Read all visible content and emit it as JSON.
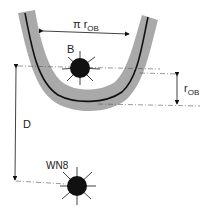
{
  "diagram": {
    "colors": {
      "band": "#a9a9a9",
      "ink": "#111111",
      "guide": "#555555",
      "background": "#ffffff"
    },
    "labels": {
      "arc_length": {
        "symbol": "π r",
        "subscript": "OB"
      },
      "body": "B",
      "radius": {
        "symbol": "r",
        "subscript": "OB"
      },
      "distance": "D",
      "source": "WN8"
    },
    "elements": {
      "band": "u-shaped-shaded-band",
      "centerline": "u-shaped-trajectory-curve",
      "body_B": "radiating-black-sphere",
      "source_WN8": "radiating-black-sphere"
    }
  }
}
